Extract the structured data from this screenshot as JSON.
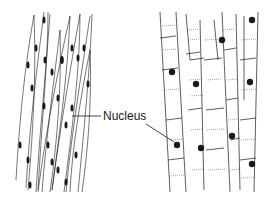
{
  "diagram": {
    "label": "Nucleus",
    "colors": {
      "ink": "#1a1a1a",
      "background": "#ffffff"
    },
    "panels": [
      {
        "name": "smooth-muscle-tissue",
        "description": "spindle-shaped cells with central elongated nuclei"
      },
      {
        "name": "striated-muscle-tissue",
        "description": "cylindrical striated cells with round nuclei"
      }
    ]
  }
}
